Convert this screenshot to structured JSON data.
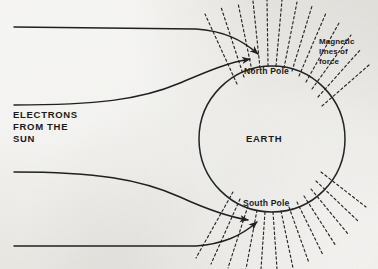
{
  "diagram": {
    "labels": {
      "electrons_line1": "ELECTRONS",
      "electrons_line2": "FROM THE",
      "electrons_line3": "SUN",
      "earth": "EARTH",
      "north_pole": "North Pole",
      "south_pole": "South Pole",
      "magnetic_line1": "Magnetic",
      "magnetic_line2": "lines of",
      "magnetic_line3": "force"
    },
    "colors": {
      "ink": "#1b1b1b",
      "paper": "#e9e8e4",
      "stroke": "#2a2a2a"
    },
    "geometry": {
      "earth_center_x": 272,
      "earth_center_y": 139,
      "earth_radius": 73,
      "north_pole_x": 272,
      "north_pole_y": 66,
      "south_pole_x": 272,
      "south_pole_y": 212,
      "electron_stream_count": 4,
      "field_line_count_north": 13,
      "field_line_count_south": 13
    },
    "icons": {
      "arrow": "arrowhead-icon",
      "earth": "earth-circle-icon",
      "field": "magnetic-field-line-icon",
      "stream": "electron-stream-icon"
    }
  }
}
